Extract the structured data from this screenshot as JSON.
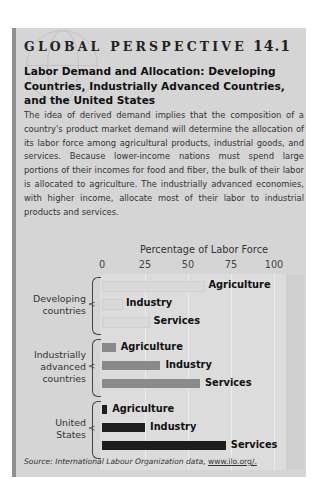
{
  "header": {
    "kicker": "GLOBAL PERSPECTIVE",
    "number": "14.1",
    "headline": "Labor Demand and Allocation: Developing Countries, Industrially Advanced Countries, and the United States",
    "body": "The idea of derived demand implies that the composition of a country's product market demand will determine the allocation of its labor force among agricultural products, industrial goods, and services. Because lower-income nations must spend large portions of their incomes for food and fiber, the bulk of their labor is allocated to agriculture. The industrially advanced economies, with higher income, allocate most of their labor to industrial products and services."
  },
  "chart_data": {
    "type": "bar",
    "orientation": "horizontal",
    "title": "Percentage of Labor Force",
    "xlabel": "Percentage of Labor Force",
    "ylabel": "",
    "xlim": [
      0,
      100
    ],
    "ticks": [
      "0",
      "25",
      "50",
      "75",
      "100"
    ],
    "grid": true,
    "groups": [
      "Developing countries",
      "Industrially advanced countries",
      "United States"
    ],
    "categories": [
      "Agriculture",
      "Industry",
      "Services"
    ],
    "series": [
      {
        "name": "Developing countries",
        "color": "#d9d9d9",
        "values": [
          59,
          11,
          27
        ]
      },
      {
        "name": "Industrially advanced countries",
        "color": "#8a8a8a",
        "values": [
          8,
          34,
          57
        ]
      },
      {
        "name": "United States",
        "color": "#1e1e1e",
        "values": [
          3,
          25,
          72
        ]
      }
    ],
    "group_labels": [
      [
        "Developing",
        "countries"
      ],
      [
        "Industrially",
        "advanced",
        "countries"
      ],
      [
        "United",
        "States"
      ]
    ]
  },
  "footer": {
    "source_prefix": "Source: International Labour Organization data, ",
    "source_link": "www.ilo.org/."
  }
}
